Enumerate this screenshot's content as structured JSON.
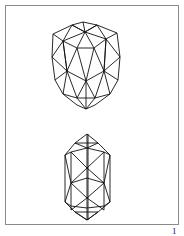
{
  "page": {
    "number": "1",
    "line_color": "#111111",
    "frame_color": "#8a8a8a"
  },
  "figures": [
    {
      "name": "faceted-gem-top",
      "description": "oval gemstone wireframe, rounded top"
    },
    {
      "name": "faceted-gem-bottom",
      "description": "elongated hexagonal gemstone wireframe"
    }
  ]
}
